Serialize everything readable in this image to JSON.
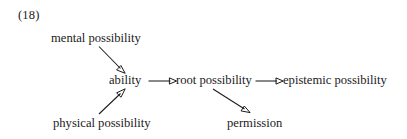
{
  "figure": {
    "example_number": "(18)",
    "type": "directed-graph",
    "background_color": "#ffffff",
    "text_color": "#1b1b1b",
    "arrow_color": "#1b1b1b"
  },
  "nodes": [
    {
      "id": "mental",
      "label": "mental possibility"
    },
    {
      "id": "physical",
      "label": "physical possibility"
    },
    {
      "id": "ability",
      "label": "ability"
    },
    {
      "id": "root",
      "label": "root possibility"
    },
    {
      "id": "epistemic",
      "label": "epistemic possibility"
    },
    {
      "id": "permission",
      "label": "permission"
    }
  ],
  "edges": [
    {
      "from": "mental",
      "to": "ability",
      "style": "diagonal-down-right"
    },
    {
      "from": "physical",
      "to": "ability",
      "style": "diagonal-up-right"
    },
    {
      "from": "ability",
      "to": "root",
      "style": "horizontal-right"
    },
    {
      "from": "root",
      "to": "epistemic",
      "style": "horizontal-right"
    },
    {
      "from": "root",
      "to": "permission",
      "style": "diagonal-down-right"
    }
  ]
}
